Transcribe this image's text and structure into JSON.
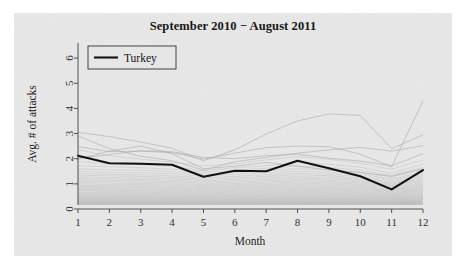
{
  "figure": {
    "background_color": "#e8e8e8",
    "page_color": "#ffffff"
  },
  "chart_data": {
    "type": "line",
    "title": "September 2010 − August 2011",
    "xlabel": "Month",
    "ylabel": "Avg. # of attacks",
    "xlim": [
      1,
      12
    ],
    "ylim": [
      0,
      6.6
    ],
    "xticks": [
      1,
      2,
      3,
      4,
      5,
      6,
      7,
      8,
      9,
      10,
      11,
      12
    ],
    "xtick_labels": [
      "1",
      "2",
      "3",
      "4",
      "5",
      "6",
      "7",
      "8",
      "9",
      "10",
      "11",
      "12"
    ],
    "yticks": [
      0,
      1,
      2,
      3,
      4,
      5,
      6
    ],
    "ytick_labels": [
      "0",
      "1",
      "2",
      "3",
      "4",
      "5",
      "6"
    ],
    "grid": false,
    "legend": {
      "position": "top-left",
      "entries": [
        {
          "label": "Turkey",
          "color": "#0b0b0b",
          "linewidth": 2.1
        }
      ]
    },
    "x": [
      1,
      2,
      3,
      4,
      5,
      6,
      7,
      8,
      9,
      10,
      11,
      12
    ],
    "highlight_series": {
      "name": "Turkey",
      "color": "#0b0b0b",
      "values": [
        2.12,
        1.82,
        1.8,
        1.76,
        1.28,
        1.52,
        1.5,
        1.92,
        1.62,
        1.3,
        0.78,
        1.55
      ]
    },
    "background_series_color": "#a9a9a9",
    "background_series_count": 64,
    "series": [
      {
        "name": "country-01",
        "values": [
          3.05,
          2.88,
          2.66,
          2.42,
          1.92,
          2.35,
          2.98,
          3.5,
          3.78,
          3.72,
          2.4,
          2.95
        ]
      },
      {
        "name": "country-02",
        "values": [
          2.48,
          2.28,
          2.3,
          2.24,
          1.98,
          2.22,
          2.44,
          2.5,
          2.48,
          2.18,
          1.68,
          4.3
        ]
      },
      {
        "name": "country-03",
        "values": [
          2.9,
          2.4,
          2.1,
          1.92,
          1.55,
          1.88,
          2.05,
          2.22,
          2.35,
          2.45,
          2.3,
          2.52
        ]
      },
      {
        "name": "country-04",
        "values": [
          2.02,
          2.16,
          2.32,
          2.28,
          2.05,
          2.0,
          2.12,
          2.18,
          2.02,
          1.9,
          1.72,
          2.2
        ]
      },
      {
        "name": "country-05",
        "values": [
          2.35,
          2.12,
          1.98,
          1.86,
          1.72,
          1.8,
          1.95,
          2.08,
          1.98,
          1.82,
          1.58,
          1.95
        ]
      },
      {
        "name": "country-06",
        "values": [
          1.88,
          1.8,
          1.76,
          1.7,
          1.52,
          1.64,
          1.72,
          1.84,
          1.78,
          1.66,
          1.42,
          1.78
        ]
      },
      {
        "name": "country-07",
        "values": [
          1.72,
          1.68,
          1.64,
          1.58,
          1.46,
          1.54,
          1.62,
          1.7,
          1.66,
          1.54,
          1.34,
          1.66
        ]
      },
      {
        "name": "country-08",
        "values": [
          1.6,
          1.56,
          1.54,
          1.48,
          1.38,
          1.46,
          1.52,
          1.6,
          1.56,
          1.46,
          1.28,
          1.56
        ]
      },
      {
        "name": "country-09",
        "values": [
          1.5,
          1.46,
          1.44,
          1.4,
          1.3,
          1.38,
          1.44,
          1.5,
          1.46,
          1.38,
          1.2,
          1.46
        ]
      },
      {
        "name": "country-10",
        "values": [
          1.42,
          1.38,
          1.36,
          1.32,
          1.24,
          1.3,
          1.36,
          1.42,
          1.38,
          1.3,
          1.14,
          1.38
        ]
      },
      {
        "name": "country-11",
        "values": [
          1.34,
          1.32,
          1.3,
          1.26,
          1.18,
          1.24,
          1.3,
          1.36,
          1.32,
          1.24,
          1.08,
          1.32
        ]
      },
      {
        "name": "country-12",
        "values": [
          1.28,
          1.25,
          1.23,
          1.2,
          1.12,
          1.18,
          1.24,
          1.29,
          1.26,
          1.18,
          1.03,
          1.26
        ]
      },
      {
        "name": "country-13",
        "values": [
          1.22,
          1.19,
          1.17,
          1.14,
          1.07,
          1.12,
          1.18,
          1.23,
          1.2,
          1.13,
          0.99,
          1.2
        ]
      },
      {
        "name": "country-14",
        "values": [
          1.16,
          1.13,
          1.12,
          1.09,
          1.02,
          1.07,
          1.12,
          1.17,
          1.14,
          1.08,
          0.95,
          1.15
        ]
      },
      {
        "name": "country-15",
        "values": [
          1.1,
          1.08,
          1.06,
          1.04,
          0.97,
          1.02,
          1.07,
          1.12,
          1.09,
          1.03,
          0.91,
          1.1
        ]
      },
      {
        "name": "country-16",
        "values": [
          1.05,
          1.03,
          1.01,
          0.99,
          0.93,
          0.97,
          1.02,
          1.07,
          1.04,
          0.98,
          0.87,
          1.05
        ]
      },
      {
        "name": "country-17",
        "values": [
          1.0,
          0.98,
          0.97,
          0.94,
          0.89,
          0.93,
          0.97,
          1.02,
          0.99,
          0.94,
          0.83,
          1.0
        ]
      },
      {
        "name": "country-18",
        "values": [
          0.95,
          0.93,
          0.92,
          0.9,
          0.85,
          0.89,
          0.93,
          0.97,
          0.95,
          0.9,
          0.79,
          0.96
        ]
      },
      {
        "name": "country-19",
        "values": [
          0.91,
          0.89,
          0.88,
          0.86,
          0.81,
          0.85,
          0.89,
          0.93,
          0.9,
          0.86,
          0.76,
          0.92
        ]
      },
      {
        "name": "country-20",
        "values": [
          0.87,
          0.85,
          0.84,
          0.82,
          0.77,
          0.81,
          0.85,
          0.89,
          0.86,
          0.82,
          0.73,
          0.88
        ]
      },
      {
        "name": "country-21",
        "values": [
          0.83,
          0.81,
          0.8,
          0.78,
          0.74,
          0.77,
          0.81,
          0.85,
          0.82,
          0.78,
          0.7,
          0.84
        ]
      },
      {
        "name": "country-22",
        "values": [
          0.79,
          0.77,
          0.76,
          0.75,
          0.7,
          0.74,
          0.77,
          0.81,
          0.79,
          0.75,
          0.67,
          0.8
        ]
      },
      {
        "name": "country-23",
        "values": [
          0.75,
          0.74,
          0.73,
          0.71,
          0.67,
          0.7,
          0.74,
          0.77,
          0.75,
          0.71,
          0.64,
          0.77
        ]
      },
      {
        "name": "country-24",
        "values": [
          0.72,
          0.7,
          0.69,
          0.68,
          0.64,
          0.67,
          0.7,
          0.74,
          0.72,
          0.68,
          0.61,
          0.73
        ]
      },
      {
        "name": "country-25",
        "values": [
          0.68,
          0.67,
          0.66,
          0.65,
          0.61,
          0.64,
          0.67,
          0.7,
          0.68,
          0.65,
          0.58,
          0.7
        ]
      },
      {
        "name": "country-26",
        "values": [
          0.65,
          0.64,
          0.63,
          0.62,
          0.58,
          0.61,
          0.64,
          0.67,
          0.65,
          0.62,
          0.56,
          0.67
        ]
      },
      {
        "name": "country-27",
        "values": [
          0.62,
          0.61,
          0.6,
          0.59,
          0.56,
          0.58,
          0.61,
          0.64,
          0.62,
          0.59,
          0.53,
          0.64
        ]
      },
      {
        "name": "country-28",
        "values": [
          0.59,
          0.58,
          0.57,
          0.56,
          0.53,
          0.55,
          0.58,
          0.61,
          0.59,
          0.56,
          0.51,
          0.61
        ]
      },
      {
        "name": "country-29",
        "values": [
          0.56,
          0.55,
          0.54,
          0.53,
          0.5,
          0.53,
          0.55,
          0.58,
          0.56,
          0.54,
          0.48,
          0.58
        ]
      },
      {
        "name": "country-30",
        "values": [
          0.53,
          0.52,
          0.52,
          0.51,
          0.48,
          0.5,
          0.53,
          0.55,
          0.54,
          0.51,
          0.46,
          0.55
        ]
      },
      {
        "name": "country-31",
        "values": [
          0.51,
          0.5,
          0.49,
          0.48,
          0.46,
          0.48,
          0.5,
          0.52,
          0.51,
          0.49,
          0.44,
          0.53
        ]
      },
      {
        "name": "country-32",
        "values": [
          0.48,
          0.47,
          0.47,
          0.46,
          0.44,
          0.45,
          0.48,
          0.5,
          0.49,
          0.46,
          0.42,
          0.5
        ]
      },
      {
        "name": "country-33",
        "values": [
          0.46,
          0.45,
          0.45,
          0.44,
          0.42,
          0.43,
          0.45,
          0.47,
          0.46,
          0.44,
          0.4,
          0.48
        ]
      },
      {
        "name": "country-34",
        "values": [
          0.44,
          0.43,
          0.43,
          0.42,
          0.4,
          0.41,
          0.43,
          0.45,
          0.44,
          0.42,
          0.38,
          0.46
        ]
      },
      {
        "name": "country-35",
        "values": [
          0.42,
          0.41,
          0.41,
          0.4,
          0.38,
          0.39,
          0.41,
          0.43,
          0.42,
          0.4,
          0.36,
          0.44
        ]
      },
      {
        "name": "country-36",
        "values": [
          0.4,
          0.39,
          0.39,
          0.38,
          0.36,
          0.38,
          0.39,
          0.41,
          0.4,
          0.38,
          0.35,
          0.42
        ]
      },
      {
        "name": "country-37",
        "values": [
          0.38,
          0.37,
          0.37,
          0.37,
          0.35,
          0.36,
          0.38,
          0.39,
          0.38,
          0.37,
          0.33,
          0.4
        ]
      },
      {
        "name": "country-38",
        "values": [
          0.36,
          0.36,
          0.35,
          0.35,
          0.33,
          0.34,
          0.36,
          0.38,
          0.37,
          0.35,
          0.32,
          0.38
        ]
      },
      {
        "name": "country-39",
        "values": [
          0.35,
          0.34,
          0.34,
          0.33,
          0.32,
          0.33,
          0.34,
          0.36,
          0.35,
          0.34,
          0.3,
          0.36
        ]
      },
      {
        "name": "country-40",
        "values": [
          0.33,
          0.33,
          0.32,
          0.32,
          0.3,
          0.31,
          0.33,
          0.34,
          0.33,
          0.32,
          0.29,
          0.35
        ]
      },
      {
        "name": "country-41",
        "values": [
          0.32,
          0.31,
          0.31,
          0.3,
          0.29,
          0.3,
          0.31,
          0.33,
          0.32,
          0.31,
          0.28,
          0.33
        ]
      },
      {
        "name": "country-42",
        "values": [
          0.3,
          0.3,
          0.3,
          0.29,
          0.28,
          0.29,
          0.3,
          0.31,
          0.31,
          0.29,
          0.27,
          0.32
        ]
      },
      {
        "name": "country-43",
        "values": [
          0.29,
          0.29,
          0.28,
          0.28,
          0.27,
          0.27,
          0.29,
          0.3,
          0.29,
          0.28,
          0.26,
          0.3
        ]
      },
      {
        "name": "country-44",
        "values": [
          0.28,
          0.27,
          0.27,
          0.27,
          0.25,
          0.26,
          0.28,
          0.29,
          0.28,
          0.27,
          0.25,
          0.29
        ]
      },
      {
        "name": "country-45",
        "values": [
          0.26,
          0.26,
          0.26,
          0.25,
          0.24,
          0.25,
          0.26,
          0.27,
          0.27,
          0.26,
          0.24,
          0.28
        ]
      },
      {
        "name": "country-46",
        "values": [
          0.25,
          0.25,
          0.25,
          0.24,
          0.23,
          0.24,
          0.25,
          0.26,
          0.26,
          0.25,
          0.23,
          0.27
        ]
      },
      {
        "name": "country-47",
        "values": [
          0.24,
          0.24,
          0.24,
          0.23,
          0.22,
          0.23,
          0.24,
          0.25,
          0.25,
          0.24,
          0.22,
          0.26
        ]
      },
      {
        "name": "country-48",
        "values": [
          0.23,
          0.23,
          0.23,
          0.22,
          0.21,
          0.22,
          0.23,
          0.24,
          0.24,
          0.23,
          0.21,
          0.25
        ]
      },
      {
        "name": "country-49",
        "values": [
          0.22,
          0.22,
          0.22,
          0.21,
          0.2,
          0.21,
          0.22,
          0.23,
          0.23,
          0.22,
          0.2,
          0.24
        ]
      },
      {
        "name": "country-50",
        "values": [
          0.21,
          0.21,
          0.21,
          0.2,
          0.19,
          0.2,
          0.21,
          0.22,
          0.22,
          0.21,
          0.19,
          0.23
        ]
      },
      {
        "name": "country-51",
        "values": [
          0.2,
          0.2,
          0.2,
          0.19,
          0.18,
          0.19,
          0.2,
          0.21,
          0.21,
          0.2,
          0.18,
          0.22
        ]
      },
      {
        "name": "country-52",
        "values": [
          0.19,
          0.19,
          0.19,
          0.18,
          0.17,
          0.18,
          0.19,
          0.2,
          0.2,
          0.19,
          0.17,
          0.21
        ]
      },
      {
        "name": "country-53",
        "values": [
          0.18,
          0.18,
          0.18,
          0.17,
          0.16,
          0.17,
          0.18,
          0.19,
          0.19,
          0.18,
          0.17,
          0.2
        ]
      },
      {
        "name": "country-54",
        "values": [
          0.17,
          0.17,
          0.17,
          0.17,
          0.16,
          0.16,
          0.17,
          0.18,
          0.18,
          0.17,
          0.16,
          0.19
        ]
      },
      {
        "name": "country-55",
        "values": [
          0.16,
          0.16,
          0.16,
          0.16,
          0.15,
          0.15,
          0.16,
          0.17,
          0.17,
          0.16,
          0.15,
          0.18
        ]
      },
      {
        "name": "country-56",
        "values": [
          0.15,
          0.15,
          0.15,
          0.15,
          0.14,
          0.15,
          0.15,
          0.16,
          0.16,
          0.15,
          0.14,
          0.17
        ]
      },
      {
        "name": "country-57",
        "values": [
          0.14,
          0.14,
          0.14,
          0.14,
          0.13,
          0.14,
          0.14,
          0.15,
          0.15,
          0.14,
          0.13,
          0.16
        ]
      },
      {
        "name": "country-58",
        "values": [
          0.13,
          0.13,
          0.13,
          0.13,
          0.12,
          0.13,
          0.13,
          0.14,
          0.14,
          0.13,
          0.12,
          0.15
        ]
      },
      {
        "name": "country-59",
        "values": [
          0.12,
          0.12,
          0.12,
          0.12,
          0.11,
          0.12,
          0.12,
          0.13,
          0.13,
          0.12,
          0.11,
          0.14
        ]
      },
      {
        "name": "country-60",
        "values": [
          0.11,
          0.11,
          0.11,
          0.11,
          0.1,
          0.11,
          0.11,
          0.12,
          0.12,
          0.11,
          0.1,
          0.13
        ]
      },
      {
        "name": "country-61",
        "values": [
          0.1,
          0.1,
          0.1,
          0.1,
          0.09,
          0.1,
          0.1,
          0.11,
          0.11,
          0.1,
          0.09,
          0.12
        ]
      },
      {
        "name": "country-62",
        "values": [
          0.09,
          0.09,
          0.09,
          0.09,
          0.08,
          0.09,
          0.09,
          0.1,
          0.1,
          0.09,
          0.08,
          0.11
        ]
      },
      {
        "name": "country-63",
        "values": [
          0.08,
          0.08,
          0.08,
          0.08,
          0.07,
          0.08,
          0.08,
          0.09,
          0.09,
          0.08,
          0.07,
          0.1
        ]
      },
      {
        "name": "country-64",
        "values": [
          1.98,
          2.3,
          2.5,
          2.2,
          1.6,
          1.7,
          1.85,
          1.7,
          1.55,
          1.45,
          1.3,
          1.6
        ]
      }
    ]
  }
}
